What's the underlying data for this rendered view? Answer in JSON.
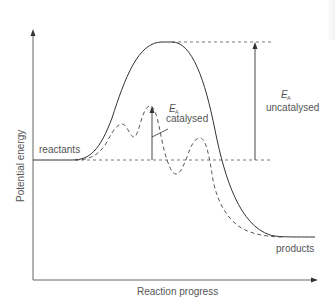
{
  "diagram": {
    "type": "energy profile",
    "axes": {
      "y_label": "Potential energy",
      "x_label": "Reaction progress"
    },
    "labels": {
      "reactants": "reactants",
      "products": "products",
      "ea_symbol": "E",
      "ea_subscript": "A",
      "catalysed": "catalysed",
      "uncatalysed": "uncatalysed"
    },
    "curves": [
      {
        "name": "uncatalysed",
        "style": "solid",
        "color": "#333333"
      },
      {
        "name": "catalysed",
        "style": "dashed",
        "color": "#444444"
      }
    ],
    "colors": {
      "line": "#333333",
      "text": "#555555",
      "background": "#ffffff"
    }
  }
}
